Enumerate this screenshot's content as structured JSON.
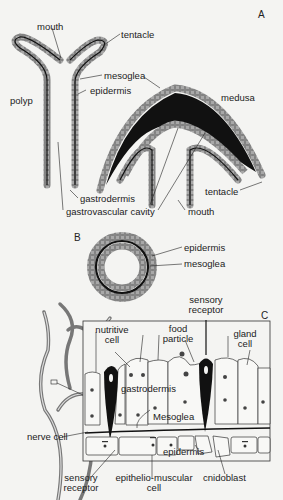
{
  "panels": {
    "a": "A",
    "b": "B",
    "c": "C"
  },
  "colors": {
    "background": "#f4f4f2",
    "cell_fill": "#a8a8a8",
    "cell_outline": "#444444",
    "mesoglea": "#111111",
    "line": "#222222"
  },
  "panel_a": {
    "polyp": "polyp",
    "mouth_top": "mouth",
    "tentacle_top": "tentacle",
    "mesoglea": "mesoglea",
    "epidermis": "epidermis",
    "medusa": "medusa",
    "gastrodermis": "gastrodermis",
    "gastrovascular_cavity": "gastrovascular cavity",
    "tentacle_bottom": "tentacle",
    "mouth_bottom": "mouth"
  },
  "panel_b": {
    "epidermis": "epidermis",
    "mesoglea": "mesoglea"
  },
  "panel_c": {
    "sensory_receptor_top_1": "sensory",
    "sensory_receptor_top_2": "receptor",
    "nutritive_cell_1": "nutritive",
    "nutritive_cell_2": "cell",
    "food_particle_1": "food",
    "food_particle_2": "particle",
    "gland_cell_1": "gland",
    "gland_cell_2": "cell",
    "gastrodermis": "gastrodermis",
    "mesoglea": "Mesoglea",
    "nerve_cell": "nerve cell",
    "epidermis": "epidermis",
    "sensory_receptor_bottom_1": "sensory",
    "sensory_receptor_bottom_2": "receptor",
    "epithelio_muscular_1": "epithelio-muscular",
    "epithelio_muscular_2": "cell",
    "cnidoblast": "cnidoblast"
  }
}
